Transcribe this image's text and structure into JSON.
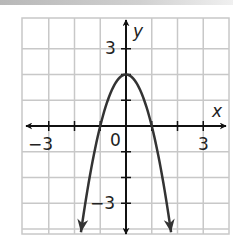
{
  "chart_data": {
    "type": "line",
    "title": "",
    "function": "y = -2x^2 + 2",
    "xlabel": "x",
    "ylabel": "y",
    "xlim": [
      -4,
      4
    ],
    "ylim": [
      -4.2,
      4.2
    ],
    "grid": true,
    "x_tick_labels": [
      {
        "value": -3,
        "label": "−3"
      },
      {
        "value": 0,
        "label": "0"
      },
      {
        "value": 3,
        "label": "3"
      }
    ],
    "y_tick_labels": [
      {
        "value": 3,
        "label": "3"
      },
      {
        "value": -3,
        "label": "−3"
      }
    ],
    "series": [
      {
        "name": "parabola",
        "color": "#333333",
        "x": [
          -1.75,
          -1.5,
          -1,
          -0.5,
          0,
          0.5,
          1,
          1.5,
          1.75
        ],
        "values": [
          -4.125,
          -2.5,
          0,
          1.5,
          2,
          1.5,
          0,
          -2.5,
          -4.125
        ]
      }
    ],
    "vertex": [
      0,
      2
    ],
    "x_intercepts": [
      -1,
      1
    ],
    "arrows": "both ends of curve point downward; both axes have arrows at both ends"
  },
  "labels": {
    "x_axis": "x",
    "y_axis": "y",
    "tick_neg3_x": "−3",
    "tick_0": "0",
    "tick_3_x": "3",
    "tick_3_y": "3",
    "tick_neg3_y": "−3"
  },
  "colors": {
    "grid": "#c8c8c8",
    "axis": "#111111",
    "curve": "#333333"
  }
}
